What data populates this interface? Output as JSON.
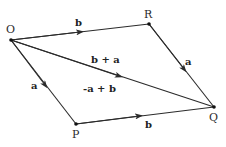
{
  "diagram": {
    "points": {
      "O": {
        "label": "O",
        "x": 11,
        "y": 40
      },
      "R": {
        "label": "R",
        "x": 149,
        "y": 24
      },
      "P": {
        "label": "P",
        "x": 76,
        "y": 124
      },
      "Q": {
        "label": "Q",
        "x": 214,
        "y": 107
      }
    },
    "edges": [
      {
        "from": "O",
        "to": "R",
        "label": "b"
      },
      {
        "from": "R",
        "to": "Q",
        "label": "a"
      },
      {
        "from": "O",
        "to": "P",
        "label": "a"
      },
      {
        "from": "P",
        "to": "Q",
        "label": "b"
      },
      {
        "from": "O",
        "to": "Q",
        "label": "b + a"
      }
    ],
    "labels": {
      "O": "O",
      "R": "R",
      "P": "P",
      "Q": "Q",
      "OR": "b",
      "RQ": "a",
      "OP": "a",
      "PQ": "b",
      "diag_upper": "b + a",
      "diag_lower": "-a + b"
    },
    "colors": {
      "line": "#2b2b2b",
      "text": "#222222",
      "background": "#ffffff"
    }
  }
}
